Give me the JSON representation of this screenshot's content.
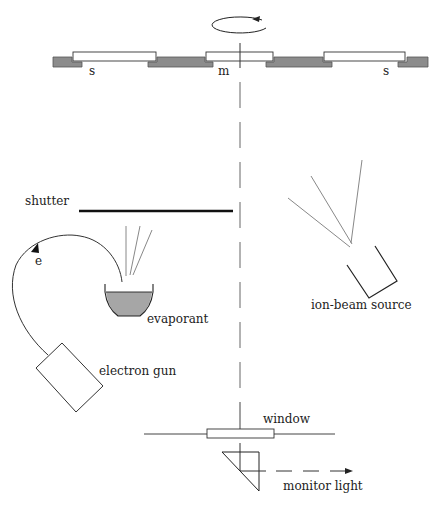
{
  "diagram": {
    "type": "ion-beam assisted deposition apparatus schematic",
    "labels": {
      "sample_left": "s",
      "monitor": "m",
      "sample_right": "s",
      "shutter": "shutter",
      "electron": "e",
      "evaporant": "evaporant",
      "ion_source": "ion-beam source",
      "electron_gun": "electron gun",
      "window": "window",
      "monitor_light": "monitor light"
    },
    "colors": {
      "line": "#222222",
      "holder_fill": "#8c8c8c",
      "evaporant_fill": "#a6a6a6",
      "beam": "#888888",
      "background": "#ffffff"
    },
    "components": [
      {
        "id": "substrate-holder",
        "description": "rotating holder with samples (s) and monitor (m)"
      },
      {
        "id": "rotation-arrow",
        "description": "counter-clockwise rotation indicator"
      },
      {
        "id": "shutter"
      },
      {
        "id": "electron-gun"
      },
      {
        "id": "crucible",
        "contents": "evaporant"
      },
      {
        "id": "ion-beam-source"
      },
      {
        "id": "window"
      },
      {
        "id": "prism"
      },
      {
        "id": "monitor-light-arrow"
      }
    ]
  }
}
